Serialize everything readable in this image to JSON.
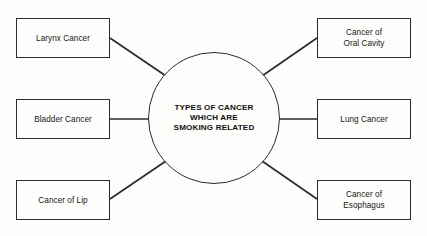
{
  "diagram": {
    "type": "hub-and-spoke",
    "hub": {
      "label": "TYPES OF CANCER\nWHICH ARE\nSMOKING RELATED",
      "shape": "circle"
    },
    "nodes": [
      {
        "id": "larynx-cancer",
        "label": "Larynx Cancer",
        "side": "left",
        "row": "top",
        "connector": "diagonal"
      },
      {
        "id": "bladder-cancer",
        "label": "Bladder Cancer",
        "side": "left",
        "row": "middle",
        "connector": "horizontal"
      },
      {
        "id": "cancer-of-lip",
        "label": "Cancer of Lip",
        "side": "left",
        "row": "bottom",
        "connector": "diagonal"
      },
      {
        "id": "cancer-of-oral-cavity",
        "label": "Cancer of\nOral Cavity",
        "side": "right",
        "row": "top",
        "connector": "diagonal"
      },
      {
        "id": "lung-cancer",
        "label": "Lung Cancer",
        "side": "right",
        "row": "middle",
        "connector": "horizontal"
      },
      {
        "id": "cancer-of-esophagus",
        "label": "Cancer of\nEsophagus",
        "side": "right",
        "row": "bottom",
        "connector": "diagonal"
      }
    ],
    "colors": {
      "stroke": "#2b2b2b",
      "text": "#161616",
      "background": "#fdfdfb"
    }
  }
}
